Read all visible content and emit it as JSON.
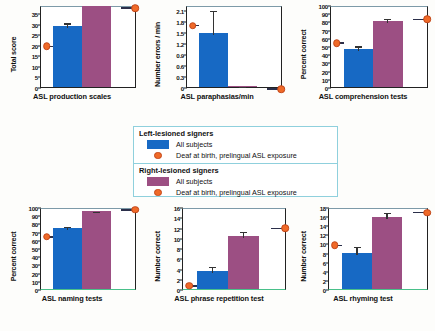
{
  "legend": {
    "sections": [
      {
        "title": "Left-lesioned signers",
        "swatch_color": "#1769c4",
        "all_label": "All subjects",
        "dot_label": "Deaf at birth, prelingual ASL exposure"
      },
      {
        "title": "Right-lesioned signers",
        "swatch_color": "#9c4f83",
        "all_label": "All subjects",
        "dot_label": "Deaf at birth, prelingual ASL exposure"
      }
    ]
  },
  "colors": {
    "left_lesioned": "#1769c4",
    "right_lesioned": "#9c4f83",
    "deaf_marker": "#f06a28"
  },
  "chart_data": [
    {
      "type": "bar",
      "title": "ASL production scales",
      "xlabel": "ASL production scales",
      "ylabel": "Total score",
      "ylim": [
        0,
        39
      ],
      "ticks": [
        0,
        5,
        10,
        15,
        20,
        25,
        30,
        35
      ],
      "categories": [
        "Left-lesioned signers",
        "Right-lesioned signers"
      ],
      "values": [
        29,
        38.5
      ],
      "errors": [
        2.2,
        0
      ],
      "deaf_points": [
        20.3,
        38.5
      ],
      "grid": false,
      "legend": "external"
    },
    {
      "type": "bar",
      "title": "ASL paraphasias/min",
      "xlabel": "ASL paraphasias/min",
      "ylabel": "Number errors / min",
      "ylim": [
        0,
        2.25
      ],
      "ticks": [
        0,
        0.3,
        0.6,
        0.9,
        1.2,
        1.5,
        1.8,
        2.1
      ],
      "categories": [
        "Left-lesioned signers",
        "Right-lesioned signers"
      ],
      "values": [
        1.49,
        0.03
      ],
      "errors": [
        0.66,
        0.02
      ],
      "deaf_points": [
        1.74,
        0.0
      ],
      "grid": false,
      "legend": "external"
    },
    {
      "type": "bar",
      "title": "ASL comprehension tests",
      "xlabel": "ASL comprehension tests",
      "ylabel": "Percent correct",
      "ylim": [
        0,
        100
      ],
      "ticks": [
        0,
        10,
        20,
        30,
        40,
        50,
        60,
        70,
        80,
        90,
        100
      ],
      "categories": [
        "Left-lesioned signers",
        "Right-lesioned signers"
      ],
      "values": [
        46,
        81
      ],
      "errors": [
        6,
        4
      ],
      "deaf_points": [
        56,
        85
      ],
      "grid": false,
      "legend": "external"
    },
    {
      "type": "bar",
      "title": "ASL naming tests",
      "xlabel": "ASL naming tests",
      "ylabel": "Percent correct",
      "ylim": [
        0,
        100
      ],
      "ticks": [
        0,
        10,
        20,
        30,
        40,
        50,
        60,
        70,
        80,
        90,
        100
      ],
      "categories": [
        "Left-lesioned signers",
        "Right-lesioned signers"
      ],
      "values": [
        74,
        95
      ],
      "errors": [
        4,
        1.5
      ],
      "deaf_points": [
        66,
        99
      ],
      "grid": false,
      "legend": "external"
    },
    {
      "type": "bar",
      "title": "ASL phrase repetition test",
      "xlabel": "ASL phrase repetition test",
      "ylabel": "Number correct",
      "ylim": [
        0,
        16
      ],
      "ticks": [
        0,
        2,
        4,
        6,
        8,
        10,
        12,
        14,
        16
      ],
      "categories": [
        "Left-lesioned signers",
        "Right-lesioned signers"
      ],
      "values": [
        3.6,
        10.3
      ],
      "errors": [
        1.1,
        1.3
      ],
      "deaf_points": [
        1.0,
        12.2
      ],
      "grid": false,
      "legend": "external"
    },
    {
      "type": "bar",
      "title": "ASL  rhyming test",
      "xlabel": "ASL  rhyming test",
      "ylabel": "Number correct",
      "ylim": [
        0,
        18
      ],
      "ticks": [
        0,
        2,
        4,
        6,
        8,
        10,
        12,
        14,
        16,
        18
      ],
      "categories": [
        "Left-lesioned signers",
        "Right-lesioned signers"
      ],
      "values": [
        7.8,
        15.8
      ],
      "errors": [
        1.9,
        1.3
      ],
      "deaf_points": [
        10.0,
        17.2
      ],
      "grid": false,
      "legend": "external"
    }
  ]
}
